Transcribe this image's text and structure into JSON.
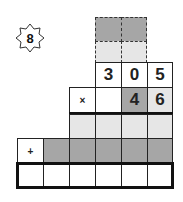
{
  "badge": {
    "number": "8",
    "icon": "eight-point-star-icon"
  },
  "problem": {
    "top_number": [
      "3",
      "0",
      "5"
    ],
    "multiplier": [
      "",
      "4",
      "6"
    ],
    "multiply_sign": "×",
    "plus_sign": "+"
  },
  "colors": {
    "dark": "#a6a6a6",
    "light": "#e6e6e6",
    "border": "#222222"
  }
}
